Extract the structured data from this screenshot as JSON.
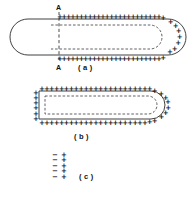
{
  "figure": {
    "panels": [
      {
        "id": "a",
        "label": "( a )",
        "label_x": 78,
        "label_y": 67,
        "description": "Longitudinal cross-section of a charged elongated body with rounded left and right caps; positive charges line the outer boundary of the right portion while inner dashed contour marks an interior surface.",
        "outer": {
          "shape": "stadium",
          "x": 10,
          "y": 19,
          "width": 158,
          "height": 36,
          "radius": 18,
          "style": "solid"
        },
        "inner": {
          "shape": "stadium",
          "x": 39,
          "y": 25,
          "width": 123,
          "height": 24,
          "radius": 12,
          "style": "dashed"
        },
        "charge_symbol": "+",
        "charge_rows": {
          "top": {
            "y": 17,
            "x_start": 58,
            "x_end": 160,
            "count": 25
          },
          "bottom": {
            "y": 60,
            "x_start": 58,
            "x_end": 160,
            "count": 25
          },
          "right_arc": {
            "cx": 160,
            "cy": 37.5,
            "r": 22,
            "count": 9,
            "angle_start": -78,
            "angle_end": 78
          }
        },
        "section_marks": {
          "symbol": "A",
          "top_label_x": 56,
          "top_label_y": 4,
          "bottom_label_x": 56,
          "bottom_label_y": 64,
          "line_x": 59,
          "line_y_top": 12,
          "line_y_bottom": 62
        }
      },
      {
        "id": "b",
        "label": "( b )",
        "label_x": 74,
        "label_y": 128,
        "description": "Cross-section A-A view: a flat-left, round-right charged body entirely surrounded by positive charges, with inner dashed contour.",
        "outer": {
          "shape": "stadium-flat-left",
          "x": 39,
          "y": 91,
          "width": 126,
          "height": 28,
          "radius": 14,
          "style": "solid"
        },
        "inner": {
          "shape": "stadium-flat-left",
          "x": 45,
          "y": 96,
          "width": 114,
          "height": 18,
          "radius": 9,
          "style": "dashed"
        },
        "charge_symbol": "+",
        "charge_rows": {
          "top": {
            "y": 88,
            "x_start": 41,
            "x_end": 157,
            "count": 24
          },
          "bottom": {
            "y": 124,
            "x_start": 41,
            "x_end": 157,
            "count": 24
          },
          "left_column": {
            "x": 35,
            "y_start": 90,
            "y_end": 121,
            "count": 6
          },
          "right_arc": {
            "cx": 151,
            "cy": 105,
            "r": 19,
            "count": 8,
            "angle_start": -78,
            "angle_end": 78
          }
        }
      },
      {
        "id": "c",
        "label": "( c )",
        "label_x": 79,
        "label_y": 178,
        "description": "Detail of the electric double layer: a column of negative charges adjacent to a column of positive charges.",
        "negative_symbol": "−",
        "positive_symbol": "+",
        "rows": 5,
        "negative_column_x": 54,
        "positive_column_x": 64,
        "y_start": 155,
        "y_step": 5.4
      }
    ]
  },
  "style_tokens": {
    "ink": "#1a1a1a",
    "line": "#2b2b2b",
    "dashed": "#3a3a3a",
    "background": "#ffffff"
  }
}
